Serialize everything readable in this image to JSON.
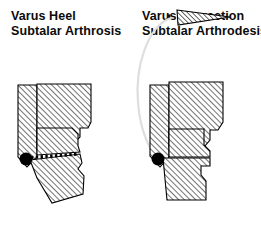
{
  "figure": {
    "background_color": "#ffffff",
    "line_color": "#000000",
    "hatch_color": "#555555",
    "arc_color": "#d8d8d8",
    "width": 261,
    "height": 236
  },
  "panels": [
    {
      "id": "varus-heel",
      "caption_line_1": "Varus Heel",
      "caption_line_2": "Subtalar Arthrosis",
      "description": "Lateral view outline of hindfoot bones with diagonal hatching, showing a varus-angulated heel fragment tilted relative to the body of the calcaneus; a dotted osteotomy line runs from the pivot point posteriorly.",
      "annotations": [
        {
          "name": "pivot-point",
          "kind": "filled-circle",
          "label": "",
          "cx": 26,
          "cy": 159,
          "r": 6.5,
          "color": "#000000"
        },
        {
          "name": "osteotomy-line",
          "kind": "dotted-line",
          "label": "",
          "x1": 31,
          "y1": 157,
          "x2": 78,
          "y2": 154,
          "color": "#000000"
        }
      ]
    },
    {
      "id": "varus-correction",
      "caption_line_1": "Varus Correction",
      "caption_line_2": "Subtalar Arthrodesis",
      "description": "Same hindfoot after correction: a hatched bone wedge has been resected and displaced above the foot, the heel fragment is rotated about the pivot into neutral alignment, and a faint arc traces the rotation of the removed wedge.",
      "annotations": [
        {
          "name": "pivot-point",
          "kind": "filled-circle",
          "label": "",
          "cx": 27,
          "cy": 159,
          "r": 6.5,
          "color": "#000000"
        },
        {
          "name": "resected-wedge",
          "kind": "hatched-triangle",
          "label": "",
          "color": "#000000"
        },
        {
          "name": "rotation-arc",
          "kind": "arc",
          "label": "",
          "color": "#d8d8d8"
        },
        {
          "name": "arc-origin-dot",
          "kind": "small-dot",
          "label": "",
          "cx": 38,
          "cy": 16,
          "r": 1.6,
          "color": "#000000"
        }
      ]
    }
  ]
}
